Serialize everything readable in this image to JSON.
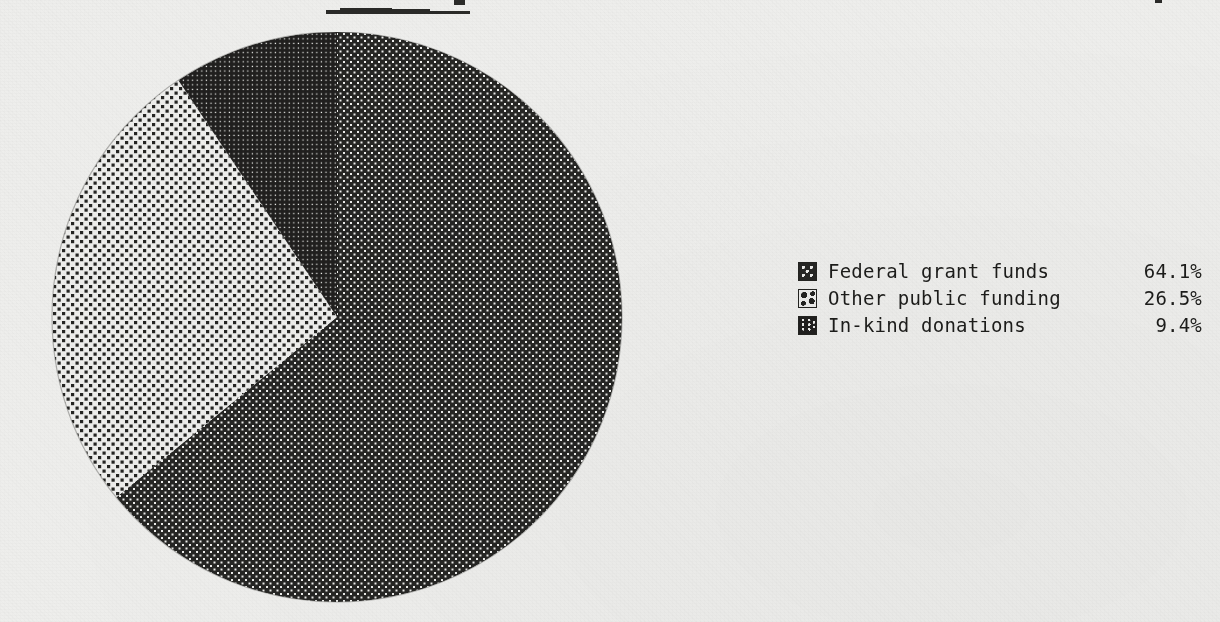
{
  "background_color": "#eeeeec",
  "ink_color": "#1c1c1a",
  "chart_data": {
    "type": "pie",
    "title": "",
    "categories": [
      "Federal grant funds",
      "Other public funding",
      "In-kind donations"
    ],
    "values": [
      64.1,
      26.5,
      9.4
    ],
    "value_labels": [
      "64.1%",
      "26.5%",
      "9.4%"
    ],
    "unit": "%",
    "start_angle_deg": 0,
    "direction": "clockwise",
    "legend_position": "right",
    "grid": false,
    "slices": [
      {
        "label": "Federal grant funds",
        "value": 64.1,
        "value_label": "64.1%",
        "pattern": "medium-dot-halftone",
        "pattern_fill": "#262624",
        "pattern_dot": "#eeeeec",
        "start_deg": 0,
        "end_deg": 230.76
      },
      {
        "label": "Other public funding",
        "value": 26.5,
        "value_label": "26.5%",
        "pattern": "light-sparse-halftone",
        "pattern_fill": "#eeeeec",
        "pattern_dot": "#242422",
        "start_deg": 230.76,
        "end_deg": 326.16
      },
      {
        "label": "In-kind donations",
        "value": 9.4,
        "value_label": "9.4%",
        "pattern": "dense-dark-halftone",
        "pattern_fill": "#201f1e",
        "pattern_dot": "#eeeeec",
        "start_deg": 326.16,
        "end_deg": 360
      }
    ]
  },
  "legend": {
    "rows": [
      {
        "swatch": "swatch-medium-dot",
        "label": "Federal grant funds",
        "value": "64.1%"
      },
      {
        "swatch": "swatch-sparse-dot",
        "label": "Other public funding",
        "value": "26.5%"
      },
      {
        "swatch": "swatch-dense-dot",
        "label": "In-kind donations",
        "value": "9.4%"
      }
    ]
  }
}
